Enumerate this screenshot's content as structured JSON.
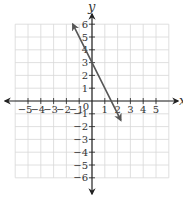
{
  "chart_data": {
    "type": "line",
    "title": "",
    "xlabel": "x",
    "ylabel": "y",
    "xlim": [
      -6,
      6
    ],
    "ylim": [
      -6,
      6
    ],
    "grid": true,
    "x_ticks": [
      -5,
      -4,
      -3,
      -2,
      -1,
      1,
      2,
      3,
      4,
      5
    ],
    "y_ticks": [
      6,
      5,
      4,
      3,
      2,
      1,
      -1,
      -2,
      -3,
      -4,
      -5,
      -6
    ],
    "origin_label": "0",
    "series": [
      {
        "name": "y = -2x + 3",
        "slope": -2,
        "intercept": 3,
        "x": [
          -1.5,
          2.25
        ],
        "y": [
          6,
          -1.5
        ],
        "arrows": "both",
        "color": "#555555"
      }
    ],
    "colors": {
      "grid": "#d8d8d8",
      "axis": "#222222",
      "line": "#555555"
    }
  }
}
